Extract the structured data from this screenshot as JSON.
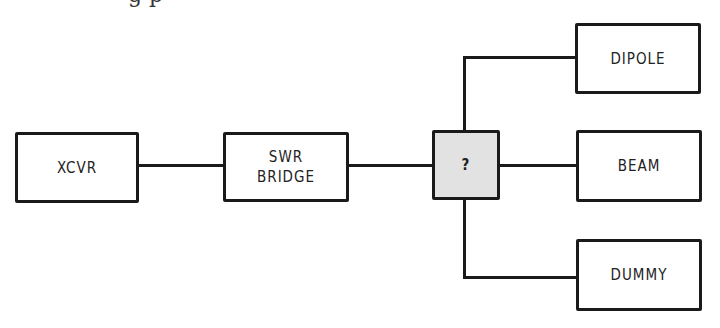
{
  "diagram": {
    "title_fragment": "g p",
    "nodes": [
      {
        "id": "xcvr",
        "label": "XCVR"
      },
      {
        "id": "swr_bridge",
        "label": "SWR\nBRIDGE"
      },
      {
        "id": "switch",
        "label": "?"
      },
      {
        "id": "dipole",
        "label": "DIPOLE"
      },
      {
        "id": "beam",
        "label": "BEAM"
      },
      {
        "id": "dummy",
        "label": "DUMMY"
      }
    ],
    "edges": [
      {
        "from": "xcvr",
        "to": "swr_bridge"
      },
      {
        "from": "swr_bridge",
        "to": "switch"
      },
      {
        "from": "switch",
        "to": "dipole"
      },
      {
        "from": "switch",
        "to": "beam"
      },
      {
        "from": "switch",
        "to": "dummy"
      }
    ],
    "colors": {
      "line": "#1a1a1a",
      "switch_fill": "#e2e2e2",
      "box_fill": "#ffffff"
    }
  }
}
